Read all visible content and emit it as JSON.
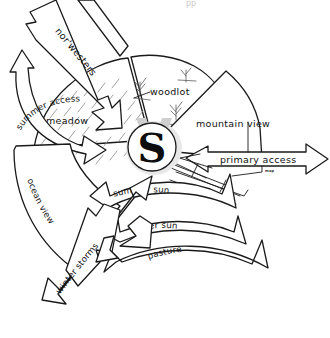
{
  "diagram": {
    "center": {
      "symbol": "S",
      "name": "site-center-marker"
    },
    "top_cropped_text": "pp",
    "style": {
      "ink": "#1a1a1a",
      "hatch": "#8a8a8a",
      "paper": "#ffffff"
    },
    "sectors": [
      {
        "id": "meadow",
        "label": "meadow",
        "kind": "zone",
        "pattern": "diagonal-hatch"
      },
      {
        "id": "woodlot",
        "label": "woodlot",
        "kind": "zone",
        "pattern": "twigs"
      },
      {
        "id": "mountain-view",
        "label": "mountain view",
        "kind": "view",
        "pattern": "plain"
      },
      {
        "id": "pasture",
        "label": "pasture",
        "kind": "zone",
        "pattern": "plain"
      },
      {
        "id": "ocean-view",
        "label": "ocean view",
        "kind": "view",
        "pattern": "plain"
      }
    ],
    "arrows": [
      {
        "id": "norwesters",
        "label": "nor'westers",
        "kind": "wind",
        "direction": "from-northwest",
        "heads": 2
      },
      {
        "id": "winter-storms",
        "label": "winter storms",
        "kind": "wind",
        "direction": "from-southwest",
        "heads": 2
      },
      {
        "id": "summer-access",
        "label": "summer access",
        "kind": "access",
        "direction": "curved-west",
        "heads": 2
      },
      {
        "id": "primary-access",
        "label": "primary access",
        "kind": "access",
        "direction": "east-west",
        "heads": 2
      },
      {
        "id": "summer-sun",
        "label": "summer sun",
        "kind": "sun",
        "direction": "arc-south",
        "heads": 1
      },
      {
        "id": "winter-sun",
        "label": "winter sun",
        "kind": "sun",
        "direction": "arc-south",
        "heads": 1
      }
    ],
    "annotations": [
      {
        "id": "map-note",
        "label": "map"
      }
    ]
  }
}
